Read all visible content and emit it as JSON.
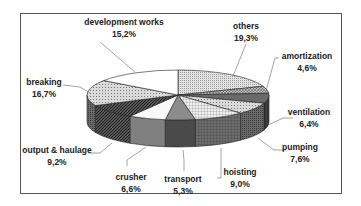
{
  "chart_data": {
    "type": "pie",
    "style": "3d-exploded-none",
    "title": "",
    "decimal_separator": ",",
    "start_angle_deg": 0,
    "direction": "clockwise",
    "slices": [
      {
        "label": "others",
        "value": 19.3,
        "display": "19,3%",
        "fill": "#d8d8d8",
        "side": "#8a8a8a",
        "pattern": "fine-dots"
      },
      {
        "label": "amortization",
        "value": 4.6,
        "display": "4,6%",
        "fill": "#b0b0b0",
        "side": "#5a5a5a",
        "pattern": "crosshatch"
      },
      {
        "label": "ventilation",
        "value": 6.4,
        "display": "6,4%",
        "fill": "#6a6a6a",
        "side": "#3a3a3a",
        "pattern": "solid"
      },
      {
        "label": "pumping",
        "value": 7.6,
        "display": "7,6%",
        "fill": "#a8a8a8",
        "side": "#555555",
        "pattern": "dots"
      },
      {
        "label": "hoisting",
        "value": 9.0,
        "display": "9,0%",
        "fill": "#e0e0e0",
        "side": "#6e6e6e",
        "pattern": "grid"
      },
      {
        "label": "transport",
        "value": 5.3,
        "display": "5,3%",
        "fill": "#8c8c8c",
        "side": "#4a4a4a",
        "pattern": "solid"
      },
      {
        "label": "crusher",
        "value": 6.6,
        "display": "6,6%",
        "fill": "#f8f8f8",
        "side": "#808080",
        "pattern": "solid"
      },
      {
        "label": "output & haulage",
        "value": 9.2,
        "display": "9,2%",
        "fill": "#9a9a9a",
        "side": "#3e3e3e",
        "pattern": "diagonal"
      },
      {
        "label": "breaking",
        "value": 16.7,
        "display": "16,7%",
        "fill": "#d0d0d0",
        "side": "#6a6a6a",
        "pattern": "dots"
      },
      {
        "label": "development works",
        "value": 15.2,
        "display": "15,2%",
        "fill": "#ffffff",
        "side": "#7a7a7a",
        "pattern": "solid"
      }
    ]
  },
  "labels": {
    "others": {
      "name": "others",
      "pct": "19,3%"
    },
    "amortization": {
      "name": "amortization",
      "pct": "4,6%"
    },
    "ventilation": {
      "name": "ventilation",
      "pct": "6,4%"
    },
    "pumping": {
      "name": "pumping",
      "pct": "7,6%"
    },
    "hoisting": {
      "name": "hoisting",
      "pct": "9,0%"
    },
    "transport": {
      "name": "transport",
      "pct": "5,3%"
    },
    "crusher": {
      "name": "crusher",
      "pct": "6,6%"
    },
    "output": {
      "name": "output & haulage",
      "pct": "9,2%"
    },
    "breaking": {
      "name": "breaking",
      "pct": "16,7%"
    },
    "development": {
      "name": "development works",
      "pct": "15,2%"
    }
  }
}
